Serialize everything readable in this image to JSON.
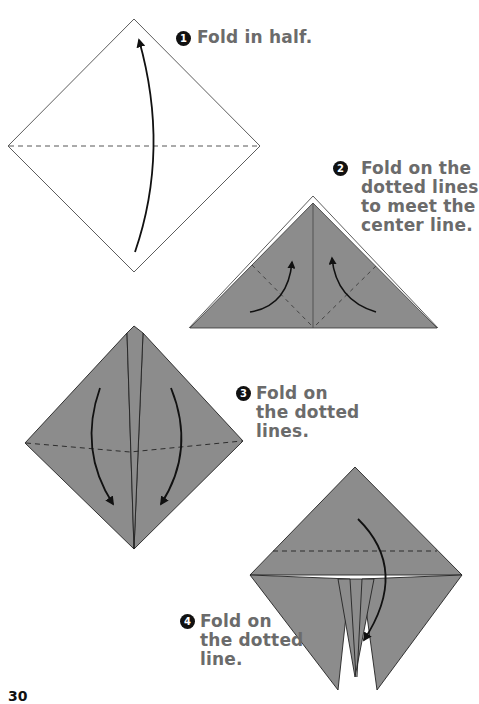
{
  "page": {
    "page_number": "30",
    "paper_color": "#8c8c8c",
    "line_color": "#111111",
    "text_color": "#6b6b6b"
  },
  "steps": [
    {
      "number": "1",
      "text": "Fold in half."
    },
    {
      "number": "2",
      "text": "Fold on the\ndotted lines\nto meet the\ncenter line."
    },
    {
      "number": "3",
      "text": "Fold on\nthe dotted\nlines."
    },
    {
      "number": "4",
      "text": "Fold on\nthe dotted\nline."
    }
  ]
}
